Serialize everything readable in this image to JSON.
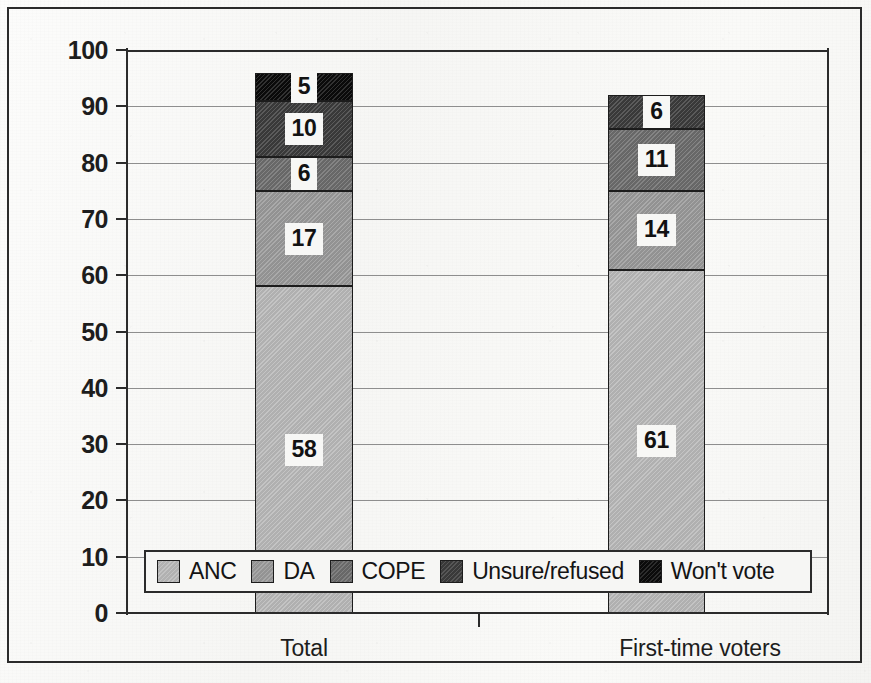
{
  "chart_data": {
    "type": "bar",
    "subtype": "stacked-bar",
    "title": "",
    "xlabel": "",
    "ylabel": "",
    "ylim": [
      0,
      100
    ],
    "yticks": [
      0,
      10,
      20,
      30,
      40,
      50,
      60,
      70,
      80,
      90,
      100
    ],
    "grid": true,
    "legend_position": "inside-bottom",
    "categories": [
      "Total",
      "First-time voters"
    ],
    "series": [
      {
        "name": "ANC",
        "values": [
          58,
          61
        ],
        "color": "#b9b9b9"
      },
      {
        "name": "DA",
        "values": [
          17,
          14
        ],
        "color": "#9a9a9a"
      },
      {
        "name": "COPE",
        "values": [
          6,
          11
        ],
        "color": "#6d6d6d"
      },
      {
        "name": "Unsure/refused",
        "values": [
          10,
          6
        ],
        "color": "#3c3c3c"
      },
      {
        "name": "Won't vote",
        "values": [
          5,
          null
        ],
        "color": "#0b0b0b"
      }
    ],
    "bar_totals": [
      96,
      92
    ],
    "value_labels": {
      "Total": [
        "58",
        "17",
        "6",
        "10",
        "5"
      ],
      "First-time voters": [
        "61",
        "14",
        "11",
        "6",
        ""
      ]
    }
  },
  "axis": {
    "y_tick_labels": [
      "100",
      "90",
      "80",
      "70",
      "60",
      "50",
      "40",
      "30",
      "20",
      "10",
      "0"
    ],
    "x_tick_labels": [
      "Total",
      "First-time voters"
    ]
  },
  "legend": {
    "items": [
      {
        "label": "ANC",
        "color": "#b9b9b9"
      },
      {
        "label": "DA",
        "color": "#9a9a9a"
      },
      {
        "label": "COPE",
        "color": "#6d6d6d"
      },
      {
        "label": "Unsure/refused",
        "color": "#3c3c3c"
      },
      {
        "label": "Won't vote",
        "color": "#0b0b0b"
      }
    ]
  }
}
